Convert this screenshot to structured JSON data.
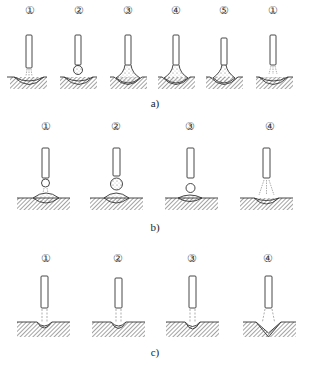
{
  "figure": {
    "panels": [
      {
        "id": "a",
        "caption": "a)",
        "steps": [
          "①",
          "②",
          "③",
          "④",
          "⑤",
          "①"
        ],
        "step_x": [
          30,
          79,
          128,
          176,
          224,
          273
        ],
        "label_y": 10,
        "caption_x": 155,
        "caption_y": 97
      },
      {
        "id": "b",
        "caption": "b)",
        "steps": [
          "①",
          "②",
          "③",
          "④"
        ],
        "step_x": [
          46,
          116,
          190,
          266
        ],
        "label_y": 118,
        "caption_x": 155,
        "caption_y": 221
      },
      {
        "id": "c",
        "caption": "c)",
        "steps": [
          "①",
          "②",
          "③",
          "④"
        ],
        "step_x": [
          46,
          118,
          192,
          268
        ],
        "label_y": 250,
        "caption_x": 155,
        "caption_y": 346
      }
    ],
    "colors": {
      "line": "#333333",
      "hatch": "#555555",
      "background": "#ffffff"
    }
  }
}
